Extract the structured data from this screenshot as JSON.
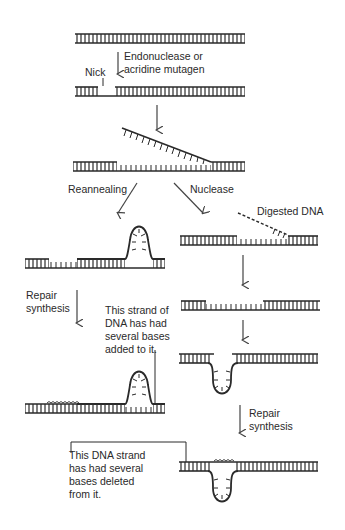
{
  "diagram": {
    "topic": "Frameshift mutation via nick, strand displacement, reannealing or nuclease digestion, and repair synthesis",
    "colors": {
      "ink": "#2a2a2a",
      "background": "#ffffff"
    },
    "labels": {
      "step1": "Endonuclease or\nacridine mutagen",
      "nick": "Nick",
      "reannealing": "Reannealing",
      "nuclease": "Nuclease",
      "digested": "Digested DNA",
      "repair_left": "Repair\nsynthesis",
      "added_note": "This strand of\nDNA has had\nseveral bases\nadded to it.",
      "repair_right": "Repair\nsynthesis",
      "deleted_note": "This DNA strand\nhas had several\nbases deleted\nfrom it."
    }
  }
}
